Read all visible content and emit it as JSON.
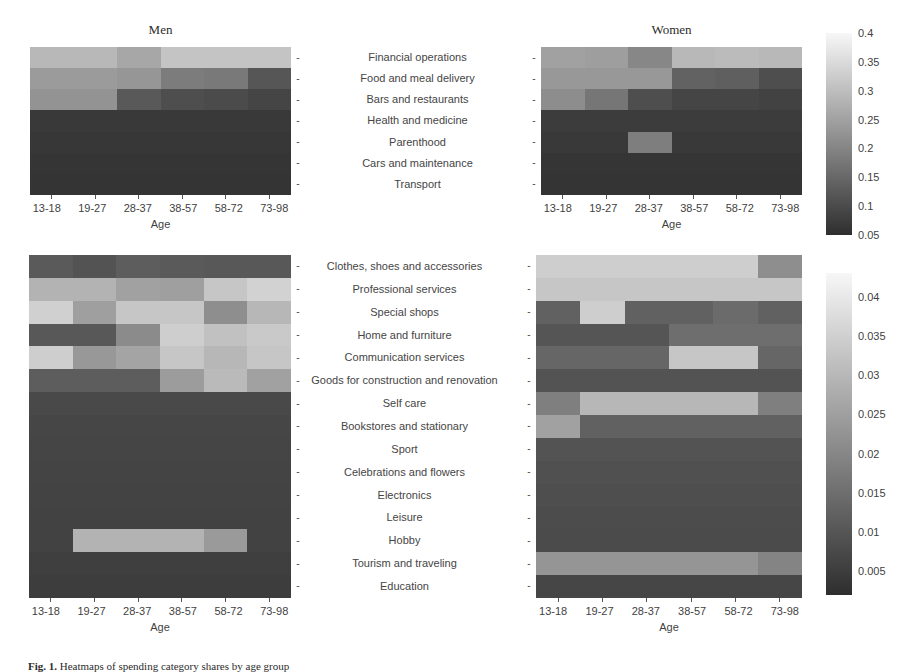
{
  "figure": {
    "caption_prefix": "Fig. 1.",
    "caption_text": "Heatmaps of spending category shares by age group"
  },
  "axis": {
    "x_title": "Age",
    "x_categories": [
      "13-18",
      "19-27",
      "28-37",
      "38-57",
      "58-72",
      "73-98"
    ],
    "tick_dash": "-"
  },
  "panels": {
    "top_left_title": "Men",
    "top_right_title": "Women",
    "bottom_left_title": "",
    "bottom_right_title": ""
  },
  "colorbars": {
    "top": {
      "vmin": 0.05,
      "vmax": 0.4,
      "ticks": [
        "0.4",
        "0.35",
        "0.3",
        "0.25",
        "0.2",
        "0.15",
        "0.1",
        "0.05"
      ],
      "tick_values": [
        0.4,
        0.35,
        0.3,
        0.25,
        0.2,
        0.15,
        0.1,
        0.05
      ]
    },
    "bottom": {
      "vmin": 0.002,
      "vmax": 0.043,
      "ticks": [
        "0.04",
        "0.035",
        "0.03",
        "0.025",
        "0.02",
        "0.015",
        "0.01",
        "0.005"
      ],
      "tick_values": [
        0.04,
        0.035,
        0.03,
        0.025,
        0.02,
        0.015,
        0.01,
        0.005
      ]
    }
  },
  "chart_data": [
    {
      "id": "men-top",
      "type": "heatmap",
      "title": "Men",
      "xlabel": "Age",
      "ylabel": "",
      "x": [
        "13-18",
        "19-27",
        "28-37",
        "38-57",
        "58-72",
        "73-98"
      ],
      "y": [
        "Financial operations",
        "Food and meal delivery",
        "Bars and restaurants",
        "Health and medicine",
        "Parenthood",
        "Cars and maintenance",
        "Transport"
      ],
      "zlim": [
        0.05,
        0.4
      ],
      "colormap": "gray-inverted",
      "grid": false,
      "values": [
        [
          0.29,
          0.29,
          0.26,
          0.31,
          0.31,
          0.31
        ],
        [
          0.24,
          0.24,
          0.23,
          0.185,
          0.18,
          0.12
        ],
        [
          0.225,
          0.225,
          0.125,
          0.105,
          0.1,
          0.09
        ],
        [
          0.07,
          0.07,
          0.07,
          0.07,
          0.07,
          0.07
        ],
        [
          0.065,
          0.065,
          0.065,
          0.065,
          0.065,
          0.065
        ],
        [
          0.062,
          0.062,
          0.062,
          0.062,
          0.062,
          0.062
        ],
        [
          0.06,
          0.06,
          0.06,
          0.06,
          0.06,
          0.06
        ]
      ]
    },
    {
      "id": "women-top",
      "type": "heatmap",
      "title": "Women",
      "xlabel": "Age",
      "ylabel": "",
      "x": [
        "13-18",
        "19-27",
        "28-37",
        "38-57",
        "58-72",
        "73-98"
      ],
      "y": [
        "Financial operations",
        "Food and meal delivery",
        "Bars and restaurants",
        "Health and medicine",
        "Parenthood",
        "Cars and maintenance",
        "Transport"
      ],
      "zlim": [
        0.05,
        0.4
      ],
      "colormap": "gray-inverted",
      "grid": false,
      "values": [
        [
          0.25,
          0.245,
          0.205,
          0.29,
          0.295,
          0.29
        ],
        [
          0.235,
          0.235,
          0.235,
          0.14,
          0.135,
          0.105
        ],
        [
          0.215,
          0.175,
          0.105,
          0.09,
          0.09,
          0.085
        ],
        [
          0.075,
          0.075,
          0.075,
          0.075,
          0.075,
          0.075
        ],
        [
          0.07,
          0.07,
          0.19,
          0.07,
          0.07,
          0.07
        ],
        [
          0.062,
          0.062,
          0.062,
          0.062,
          0.062,
          0.062
        ],
        [
          0.06,
          0.06,
          0.06,
          0.06,
          0.06,
          0.06
        ]
      ]
    },
    {
      "id": "men-bottom",
      "type": "heatmap",
      "title": "",
      "xlabel": "Age",
      "ylabel": "",
      "x": [
        "13-18",
        "19-27",
        "28-37",
        "38-57",
        "58-72",
        "73-98"
      ],
      "y": [
        "Clothes, shoes and accessories",
        "Professional services",
        "Special shops",
        "Home and furniture",
        "Communication services",
        "Goods for construction and renovation",
        "Self care",
        "Bookstores and stationary",
        "Sport",
        "Celebrations and flowers",
        "Electronics",
        "Leisure",
        "Hobby",
        "Tourism and traveling",
        "Education"
      ],
      "zlim": [
        0.002,
        0.043
      ],
      "colormap": "gray-inverted",
      "grid": false,
      "values": [
        [
          0.011,
          0.0095,
          0.0115,
          0.011,
          0.0105,
          0.0105
        ],
        [
          0.029,
          0.029,
          0.0255,
          0.025,
          0.033,
          0.0355
        ],
        [
          0.035,
          0.025,
          0.033,
          0.033,
          0.0215,
          0.03
        ],
        [
          0.0105,
          0.0105,
          0.021,
          0.0345,
          0.032,
          0.0335
        ],
        [
          0.0345,
          0.0235,
          0.026,
          0.033,
          0.03,
          0.033
        ],
        [
          0.0115,
          0.0115,
          0.0115,
          0.0245,
          0.0305,
          0.0255
        ],
        [
          0.0075,
          0.0075,
          0.0075,
          0.0075,
          0.0075,
          0.0075
        ],
        [
          0.007,
          0.007,
          0.007,
          0.007,
          0.007,
          0.007
        ],
        [
          0.0068,
          0.0068,
          0.0068,
          0.0068,
          0.0068,
          0.0068
        ],
        [
          0.0065,
          0.0065,
          0.0065,
          0.0065,
          0.0065,
          0.0065
        ],
        [
          0.0063,
          0.0063,
          0.0063,
          0.0063,
          0.0063,
          0.0063
        ],
        [
          0.006,
          0.006,
          0.006,
          0.006,
          0.006,
          0.006
        ],
        [
          0.006,
          0.029,
          0.029,
          0.029,
          0.024,
          0.006
        ],
        [
          0.0055,
          0.0055,
          0.0055,
          0.0055,
          0.0055,
          0.0055
        ],
        [
          0.005,
          0.005,
          0.005,
          0.005,
          0.005,
          0.005
        ]
      ]
    },
    {
      "id": "women-bottom",
      "type": "heatmap",
      "title": "",
      "xlabel": "Age",
      "ylabel": "",
      "x": [
        "13-18",
        "19-27",
        "28-37",
        "38-57",
        "58-72",
        "73-98"
      ],
      "y": [
        "Clothes, shoes and accessories",
        "Professional services",
        "Special shops",
        "Home and furniture",
        "Communication services",
        "Goods for construction and renovation",
        "Self care",
        "Bookstores and stationary",
        "Sport",
        "Celebrations and flowers",
        "Electronics",
        "Leisure",
        "Hobby",
        "Tourism and traveling",
        "Education"
      ],
      "zlim": [
        0.002,
        0.043
      ],
      "colormap": "gray-inverted",
      "grid": false,
      "values": [
        [
          0.0345,
          0.0345,
          0.0345,
          0.0345,
          0.0345,
          0.0215
        ],
        [
          0.033,
          0.033,
          0.033,
          0.033,
          0.033,
          0.033
        ],
        [
          0.0125,
          0.0345,
          0.0125,
          0.0125,
          0.0145,
          0.0125
        ],
        [
          0.01,
          0.01,
          0.01,
          0.015,
          0.015,
          0.015
        ],
        [
          0.0135,
          0.0135,
          0.0135,
          0.033,
          0.033,
          0.0135
        ],
        [
          0.0095,
          0.0095,
          0.0095,
          0.0095,
          0.0095,
          0.0095
        ],
        [
          0.0185,
          0.03,
          0.03,
          0.03,
          0.03,
          0.0185
        ],
        [
          0.0255,
          0.0125,
          0.0125,
          0.0125,
          0.0125,
          0.0125
        ],
        [
          0.0095,
          0.0095,
          0.0095,
          0.0095,
          0.0095,
          0.0095
        ],
        [
          0.009,
          0.009,
          0.009,
          0.009,
          0.009,
          0.009
        ],
        [
          0.0085,
          0.0085,
          0.0085,
          0.0085,
          0.0085,
          0.0085
        ],
        [
          0.0082,
          0.0082,
          0.0082,
          0.0082,
          0.0082,
          0.0082
        ],
        [
          0.008,
          0.008,
          0.008,
          0.008,
          0.008,
          0.008
        ],
        [
          0.023,
          0.023,
          0.023,
          0.023,
          0.023,
          0.0195
        ],
        [
          0.007,
          0.007,
          0.007,
          0.007,
          0.007,
          0.007
        ]
      ]
    }
  ]
}
